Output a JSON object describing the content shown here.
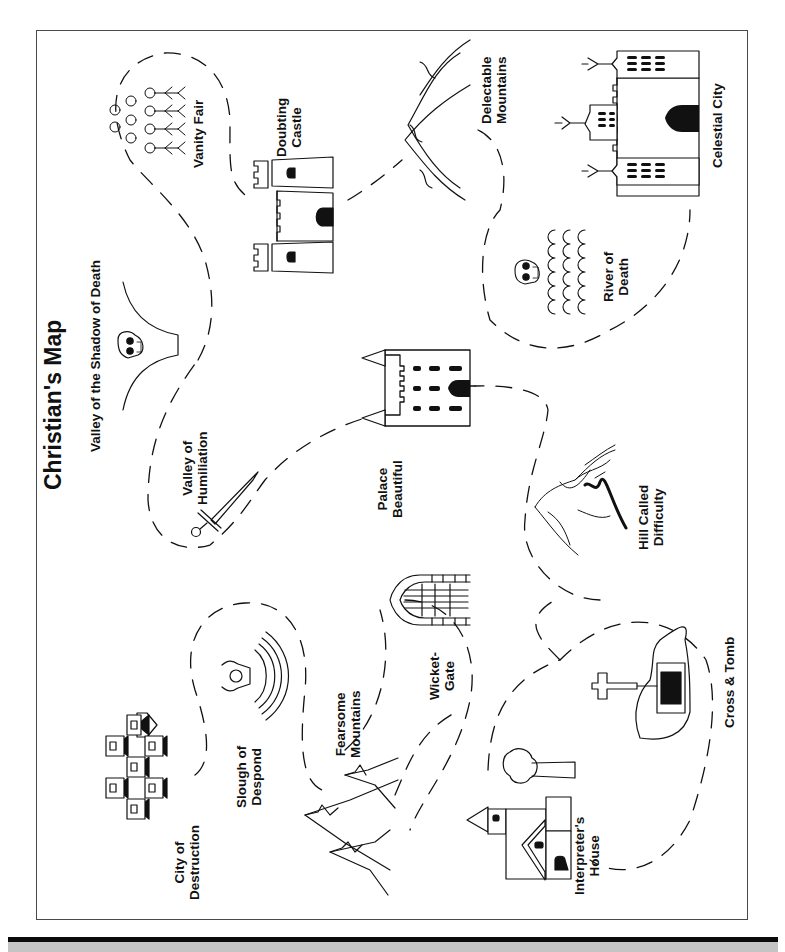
{
  "map": {
    "title": "Christian's Map",
    "colors": {
      "ink": "#111111",
      "frame": "#4a4a4a",
      "background": "#ffffff",
      "bottom_bar": "#0a0a0a",
      "bottom_gray": "#c4c4c4"
    },
    "locations": [
      {
        "id": "city-of-destruction",
        "line1": "City of",
        "line2": "Destruction",
        "icon": "houses-icon"
      },
      {
        "id": "slough-of-despond",
        "line1": "Slough of",
        "line2": "Despond",
        "icon": "sinking-figure-icon"
      },
      {
        "id": "fearsome-mountains",
        "line1": "Fearsome",
        "line2": "Mountains",
        "icon": "jagged-mountains-icon"
      },
      {
        "id": "wicket-gate",
        "line1": "Wicket-",
        "line2": "Gate",
        "icon": "gate-icon"
      },
      {
        "id": "interpreters-house",
        "line1": "Interpreter's",
        "line2": "House",
        "icon": "house-with-tree-icon"
      },
      {
        "id": "cross-and-tomb",
        "line1": "Cross & Tomb",
        "line2": "",
        "icon": "cross-tomb-icon"
      },
      {
        "id": "hill-called-difficulty",
        "line1": "Hill Called",
        "line2": "Difficulty",
        "icon": "hill-icon"
      },
      {
        "id": "palace-beautiful",
        "line1": "Palace",
        "line2": "Beautiful",
        "icon": "palace-icon"
      },
      {
        "id": "valley-of-humiliation",
        "line1": "Valley of",
        "line2": "Humiliation",
        "icon": "sword-icon"
      },
      {
        "id": "valley-of-shadow",
        "line1": "Valley of the Shadow of Death",
        "line2": "",
        "icon": "skull-valley-icon"
      },
      {
        "id": "vanity-fair",
        "line1": "Vanity Fair",
        "line2": "",
        "icon": "crowd-icon"
      },
      {
        "id": "doubting-castle",
        "line1": "Doubting",
        "line2": "Castle",
        "icon": "castle-icon"
      },
      {
        "id": "delectable-mountains",
        "line1": "Delectable",
        "line2": "Mountains",
        "icon": "mountains-icon"
      },
      {
        "id": "river-of-death",
        "line1": "River of",
        "line2": "Death",
        "icon": "skull-river-icon"
      },
      {
        "id": "celestial-city",
        "line1": "Celestial City",
        "line2": "",
        "icon": "celestial-city-icon"
      }
    ]
  }
}
